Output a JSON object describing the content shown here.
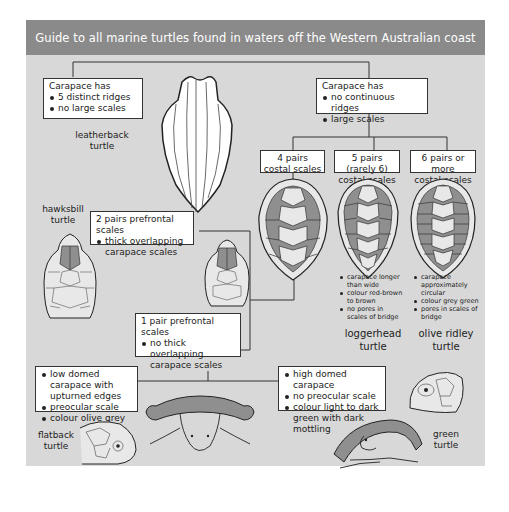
{
  "title": "Guide to all marine turtles found in waters off the Western Australian coast",
  "colors": {
    "header_bg": "#8a8a8a",
    "panel_bg": "#d8d8d8",
    "scale_shade": "#8f8f8f",
    "box_bg": "#ffffff"
  },
  "nodes": {
    "leatherback_key": {
      "heading": "Carapace has",
      "bullets": [
        "5 distinct ridges",
        "no large scales"
      ]
    },
    "leatherback_name": "leatherback turtle",
    "hard_shell_key": {
      "heading": "Carapace has",
      "bullets": [
        "no continuous ridges",
        "large scales"
      ]
    },
    "four_pairs": {
      "line1": "4 pairs",
      "line2": "costal scales"
    },
    "five_pairs": {
      "line1": "5 pairs (rarely 6)",
      "line2": "costal scales"
    },
    "six_pairs": {
      "line1": "6 pairs or more",
      "line2": "costal scales"
    },
    "two_prefrontal": {
      "heading": "2 pairs prefrontal scales",
      "bullets": [
        "thick overlapping carapace scales"
      ]
    },
    "hawksbill_name": {
      "line1": "hawksbill",
      "line2": "turtle"
    },
    "one_prefrontal": {
      "heading": "1 pair prefrontal scales",
      "bullets": [
        "no thick overlapping carapace scales"
      ]
    },
    "loggerhead": {
      "notes": [
        "carapace longer than wide",
        "colour red-brown to brown",
        "no pores in scales of bridge"
      ],
      "name_line1": "loggerhead",
      "name_line2": "turtle"
    },
    "olive_ridley": {
      "notes": [
        "carapace approximately circular",
        "colour grey green",
        "pores in scales of bridge"
      ],
      "name_line1": "olive ridley",
      "name_line2": "turtle"
    },
    "flatback_key": {
      "bullets": [
        "low domed carapace with upturned edges",
        "preocular scale",
        "colour olive grey"
      ]
    },
    "flatback_name": {
      "line1": "flatback",
      "line2": "turtle"
    },
    "green_key": {
      "bullets": [
        "high domed carapace",
        "no preocular scale",
        "colour light to dark green with dark mottling"
      ]
    },
    "green_name": {
      "line1": "green",
      "line2": "turtle"
    }
  }
}
